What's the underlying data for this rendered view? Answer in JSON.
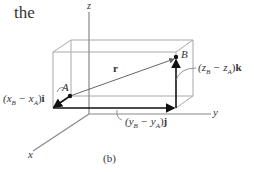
{
  "header_text": "the",
  "axes": {
    "z": "z",
    "y": "y",
    "x": "x"
  },
  "points": {
    "A": "A",
    "B": "B"
  },
  "vector_label": "r",
  "components": {
    "i": {
      "coef": "(x",
      "sub1": "B",
      "minus": " − x",
      "sub2": "A",
      "close": ")",
      "unit": "i"
    },
    "j": {
      "coef": "(y",
      "sub1": "B",
      "minus": " − y",
      "sub2": "A",
      "close": ")",
      "unit": "j"
    },
    "k": {
      "coef": "(z",
      "sub1": "B",
      "minus": " − z",
      "sub2": "A",
      "close": ")",
      "unit": "k"
    }
  },
  "caption": "(b)",
  "colors": {
    "line": "#444444",
    "box": "#9a9a9a",
    "axis": "#888888",
    "vector": "#111111",
    "text": "#333333"
  }
}
